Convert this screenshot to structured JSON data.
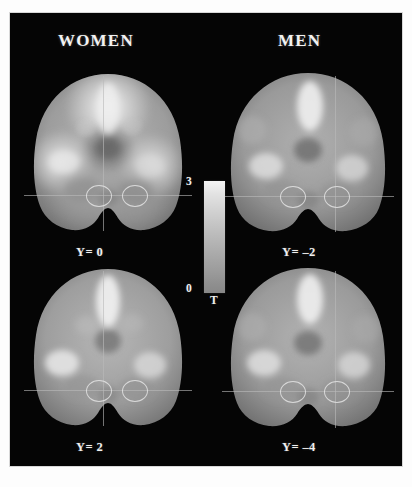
{
  "figure": {
    "background_color": "#ffffff",
    "panel_color": "#050505",
    "type": "neuroimaging-coronal-slices"
  },
  "headings": {
    "women": "WOMEN",
    "men": "MEN"
  },
  "colorbar": {
    "max_label": "3",
    "min_label": "0",
    "unit_label": "T",
    "max_value": 3,
    "min_value": 0,
    "colormap": "grayscale",
    "top_color": "#f4f4f4",
    "bottom_color": "#888888"
  },
  "slices": [
    {
      "id": "women-y0",
      "group": "WOMEN",
      "label": "Y= 0",
      "y_coordinate": 0,
      "row": "top",
      "column": "left"
    },
    {
      "id": "men-y-2",
      "group": "MEN",
      "label": "Y= –2",
      "y_coordinate": -2,
      "row": "top",
      "column": "right"
    },
    {
      "id": "women-y2",
      "group": "WOMEN",
      "label": "Y= 2",
      "y_coordinate": 2,
      "row": "bottom",
      "column": "left"
    },
    {
      "id": "men-y-4",
      "group": "MEN",
      "label": "Y= –4",
      "y_coordinate": -4,
      "row": "bottom",
      "column": "right"
    }
  ],
  "caption": {
    "partial_text": " "
  }
}
